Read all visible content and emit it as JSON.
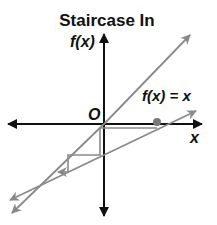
{
  "title": "Staircase In",
  "labels": {
    "y_axis": "f(x)",
    "x_axis": "x",
    "origin": "O",
    "line_label": "f(x) = x"
  },
  "colors": {
    "axis": "#111111",
    "line": "#8a8a8a",
    "dot": "#7a7a7a",
    "text": "#111111"
  },
  "geometry": {
    "origin": [
      104,
      124
    ],
    "identity_line": {
      "from": [
        12,
        213
      ],
      "to": [
        190,
        35
      ]
    },
    "function_line": {
      "from": [
        10,
        200
      ],
      "to": [
        196,
        111
      ]
    },
    "start_point": [
      157,
      122
    ],
    "staircase": [
      [
        157,
        128
      ],
      [
        100,
        128
      ],
      [
        100,
        155
      ],
      [
        68,
        155
      ],
      [
        68,
        172
      ],
      [
        60,
        172
      ]
    ]
  }
}
